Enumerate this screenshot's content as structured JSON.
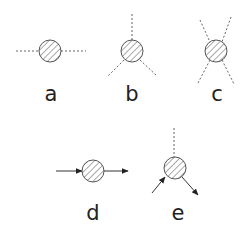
{
  "diagram": {
    "type": "feynman-like vertex diagrams",
    "colors": {
      "stroke": "#555555",
      "fill": "#ffffff",
      "hatch": "#555555",
      "label": "#222222"
    },
    "panels": [
      {
        "id": "a",
        "label": "a",
        "description": "hatched blob with two dashed external lines (left and right)"
      },
      {
        "id": "b",
        "label": "b",
        "description": "hatched blob with three dashed external lines (up, lower-left, lower-right)"
      },
      {
        "id": "c",
        "label": "c",
        "description": "hatched blob with four dashed external lines (X shape)"
      },
      {
        "id": "d",
        "label": "d",
        "description": "hatched blob with solid incoming arrow from left and outgoing arrow to right"
      },
      {
        "id": "e",
        "label": "e",
        "description": "hatched blob with dashed line up, solid incoming arrow from lower-left, outgoing arrow to lower-right"
      }
    ]
  }
}
